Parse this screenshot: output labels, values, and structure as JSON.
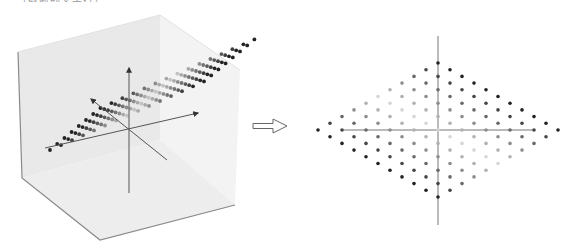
{
  "caption_fragment": "…（截断的文字行）…",
  "figure": {
    "left_panel": {
      "name": "3d-cube-with-plane",
      "cube": {
        "back_top": [
          160,
          15
        ],
        "top_left": [
          18,
          52
        ],
        "bottom_left": [
          22,
          178
        ],
        "bottom_front": [
          100,
          240
        ],
        "bottom_right": [
          235,
          205
        ],
        "right_top": [
          240,
          70
        ],
        "face_color_left": "#e9e9e9",
        "face_color_right": "#f3f3f3",
        "face_color_bottom": "#ededed",
        "edge_color": "#8a8a8a"
      },
      "plane": {
        "origin": [
          96,
          106
        ],
        "col_step": [
          11.2,
          -0.05
        ],
        "row_step": [
          -7.1,
          6.4
        ],
        "cols": 11,
        "rows": 8,
        "shear_row_offset": [
          7.3,
          -0.1
        ]
      },
      "axes": {
        "vertical": {
          "from": [
            129,
            193
          ],
          "to": [
            129,
            68
          ]
        },
        "horizontal": {
          "from": [
            45,
            148
          ],
          "to": [
            198,
            113
          ]
        },
        "depth": {
          "from": [
            167,
            160
          ],
          "to": [
            91,
            99
          ]
        },
        "color": "#555555"
      }
    },
    "transform_arrow": {
      "x": 253,
      "y": 126,
      "width": 38,
      "height": 14,
      "label": "⇨"
    },
    "right_panel": {
      "name": "2d-diamond-projection",
      "center": [
        438,
        130
      ],
      "step_x": 12,
      "step_y": 6.7,
      "radius": 10,
      "vertical_axis": {
        "from": [
          438,
          36
        ],
        "to": [
          438,
          225
        ]
      },
      "horizontal_axis": {
        "from": [
          342,
          130
        ],
        "to": [
          534,
          130
        ]
      },
      "axis_color": "#777777",
      "dot_dark": "#222222",
      "dot_light": "#dddddd"
    }
  }
}
